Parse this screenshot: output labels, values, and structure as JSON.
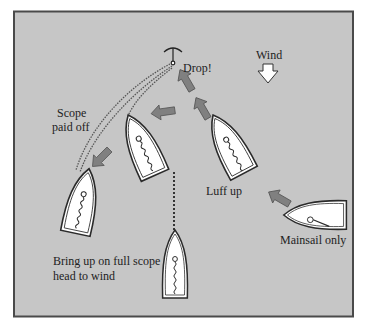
{
  "diagram": {
    "colors": {
      "background": "#c6c6c6",
      "frame": "#4a4a4a",
      "boat_fill": "#ffffff",
      "boat_stroke": "#2a2a2a",
      "arrow_fill": "#808080",
      "arrow_stroke": "#555555",
      "text": "#222222"
    },
    "labels": {
      "drop": "Drop!",
      "wind": "Wind",
      "scope_line1": "Scope",
      "scope_line2": "paid off",
      "luff_up": "Luff up",
      "mainsail_only": "Mainsail only",
      "bring_up_line1": "Bring up on full scope",
      "bring_up_line2": "head to wind"
    },
    "boats": [
      {
        "id": "mainsail-only",
        "cx": 316,
        "cy": 215,
        "angle": -90
      },
      {
        "id": "luff-up",
        "cx": 231,
        "cy": 145,
        "angle": -28
      },
      {
        "id": "drifting-back",
        "cx": 142,
        "cy": 145,
        "angle": -22
      },
      {
        "id": "scope-paid-off",
        "cx": 82,
        "cy": 200,
        "angle": 12
      },
      {
        "id": "head-to-wind",
        "cx": 175,
        "cy": 265,
        "angle": 0
      }
    ],
    "icons": [
      "anchor-icon",
      "wind-arrow-icon",
      "direction-arrow-icon"
    ]
  }
}
